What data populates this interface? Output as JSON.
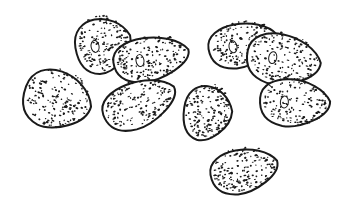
{
  "illustration": {
    "subject": "seeds",
    "style": "pen-and-ink stipple",
    "background": "#ffffff",
    "ink": "#1a1a1a",
    "seed_count": 9,
    "seeds": [
      {
        "cx": 58,
        "cy": 98,
        "rx": 34,
        "ry": 32,
        "rot": 20,
        "hilum": false
      },
      {
        "cx": 103,
        "cy": 43,
        "rx": 28,
        "ry": 30,
        "rot": -10,
        "hilum": true
      },
      {
        "cx": 151,
        "cy": 57,
        "rx": 38,
        "ry": 24,
        "rot": -8,
        "hilum": true
      },
      {
        "cx": 139,
        "cy": 102,
        "rx": 38,
        "ry": 25,
        "rot": -20,
        "hilum": false
      },
      {
        "cx": 208,
        "cy": 111,
        "rx": 24,
        "ry": 30,
        "rot": 8,
        "hilum": false
      },
      {
        "cx": 243,
        "cy": 43,
        "rx": 35,
        "ry": 24,
        "rot": -10,
        "hilum": true
      },
      {
        "cx": 284,
        "cy": 58,
        "rx": 37,
        "ry": 28,
        "rot": 12,
        "hilum": true
      },
      {
        "cx": 295,
        "cy": 101,
        "rx": 35,
        "ry": 26,
        "rot": 5,
        "hilum": true
      },
      {
        "cx": 244,
        "cy": 169,
        "rx": 34,
        "ry": 24,
        "rot": -10,
        "hilum": false
      }
    ]
  }
}
